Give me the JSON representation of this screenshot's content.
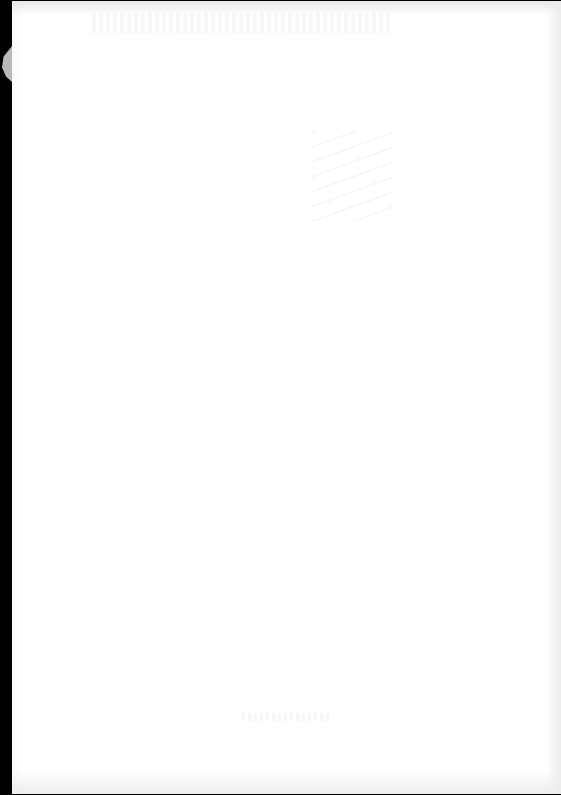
{
  "document": {
    "type": "scanned-page",
    "state": "blank",
    "visible_text": "",
    "colors": {
      "page": "#ffffff",
      "scanner_background": "#000000",
      "tear": "#b9b9b9"
    }
  }
}
